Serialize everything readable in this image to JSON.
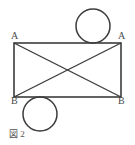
{
  "figure": {
    "caption": "図 2",
    "background_color": "#ffffff",
    "stroke_color": "#3c3c3c",
    "label_color": "#4a4a4a",
    "stroke_width": 1.6,
    "labels": {
      "top_left": "A",
      "top_right": "A",
      "bottom_left": "B",
      "bottom_right": "B"
    },
    "rectangle": {
      "x": 14,
      "y": 43,
      "width": 107,
      "height": 54
    },
    "diagonals": [
      {
        "name": "diagonal-top-left-to-bottom-right",
        "x1": 14,
        "y1": 43,
        "x2": 121,
        "y2": 97
      },
      {
        "name": "diagonal-bottom-left-to-top-right",
        "x1": 14,
        "y1": 97,
        "x2": 121,
        "y2": 43
      }
    ],
    "circles": [
      {
        "name": "circle-top",
        "cx": 93,
        "cy": 26,
        "r": 17
      },
      {
        "name": "circle-bottom",
        "cx": 40,
        "cy": 114,
        "r": 17
      }
    ]
  }
}
